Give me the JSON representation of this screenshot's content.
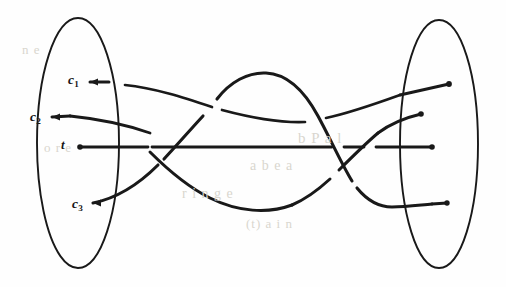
{
  "figure": {
    "kind": "hand-drawn-tangle-diagram",
    "title": "",
    "background_color": "#fefefe",
    "ink_color": "#191919",
    "left_region": {
      "name": "left-ellipse",
      "cx": 78,
      "cy": 143,
      "rx": 41,
      "ry": 125
    },
    "right_region": {
      "name": "right-ellipse",
      "cx": 439,
      "cy": 144,
      "rx": 39,
      "ry": 124
    },
    "left_labels": [
      {
        "id": "c1",
        "base": "c",
        "sub": "1",
        "x": 68,
        "y": 73
      },
      {
        "id": "c2",
        "base": "c",
        "sub": "2",
        "x": 30,
        "y": 110
      },
      {
        "id": "t",
        "base": "t",
        "sub": "",
        "x": 61,
        "y": 138
      },
      {
        "id": "c3",
        "base": "c",
        "sub": "3",
        "x": 72,
        "y": 197
      }
    ],
    "left_endpoints": [
      {
        "id": "c1-arrowhead",
        "x": 90,
        "y": 82,
        "type": "arrow-left"
      },
      {
        "id": "c2-arrowhead",
        "x": 52,
        "y": 117,
        "type": "arrow-left"
      },
      {
        "id": "t-dot",
        "x": 80,
        "y": 147,
        "type": "dot"
      },
      {
        "id": "c3-arrowhead",
        "x": 93,
        "y": 203,
        "type": "arrow-left"
      }
    ],
    "right_endpoints": [
      {
        "id": "r1",
        "x": 449,
        "y": 84,
        "type": "dot"
      },
      {
        "id": "r2",
        "x": 421,
        "y": 114,
        "type": "dot"
      },
      {
        "id": "r3",
        "x": 432,
        "y": 147,
        "type": "dot"
      },
      {
        "id": "r4",
        "x": 447,
        "y": 203,
        "type": "dot"
      }
    ],
    "strands": [
      {
        "id": "strand-horizontal-t",
        "from": "t",
        "to": "r3",
        "description": "straight horizontal line through middle"
      },
      {
        "id": "strand-c1",
        "from": "c1",
        "to": "r1",
        "description": "gentle descending then ascending curve crossing others"
      },
      {
        "id": "strand-c2",
        "from": "c2",
        "to": "r2",
        "description": "descends under middle line, dips low, rises to right"
      },
      {
        "id": "strand-c3",
        "from": "c3",
        "to": "r4",
        "description": "rises over middle line, arcs over hump, descends to bottom right"
      }
    ],
    "bleed_text": [
      {
        "text": "b  P   a   l",
        "x": 298,
        "y": 130,
        "size": 15
      },
      {
        "text": "a     b   e   a",
        "x": 250,
        "y": 158,
        "size": 14
      },
      {
        "text": "r   i   n   g   e",
        "x": 182,
        "y": 186,
        "size": 14
      },
      {
        "text": "(t)   a   i   n",
        "x": 246,
        "y": 216,
        "size": 13
      },
      {
        "text": "o  r   e",
        "x": 44,
        "y": 140,
        "size": 13
      },
      {
        "text": "n  e",
        "x": 22,
        "y": 42,
        "size": 13
      }
    ]
  }
}
